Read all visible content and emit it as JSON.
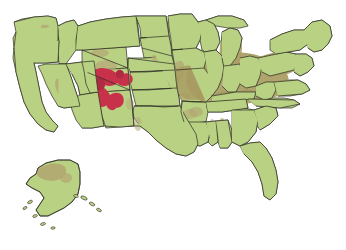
{
  "map": {
    "title": "United States Distribution Map",
    "type": "choropleth-overlay-map",
    "background_color": "#ffffff",
    "projection_note": "Albers-like continental US with Alaska inset at lower left",
    "legend_present": false,
    "labels_present": false,
    "colors": {
      "base_land": "#b9d183",
      "base_land_alt": "#bdd68a",
      "moderate_overlay": "#b3a673",
      "moderate_overlay_strong": "#a89b62",
      "moderate_overlay_soft": "#b8ac7e",
      "high_highlight": "#c8314a",
      "high_highlight_dark": "#b02a42",
      "border": "#2b2b22",
      "coast_border": "#333328",
      "water": "#ffffff"
    },
    "regions": {
      "high_intensity": {
        "name": "Four Corners core",
        "color": "#c8314a",
        "states": [
          "Colorado",
          "Utah",
          "New Mexico",
          "Arizona"
        ],
        "description": "Dense crimson cluster straddling southwestern Colorado, southeastern Utah, northwestern New Mexico and northeastern Arizona"
      },
      "moderate_intensity": {
        "name": "Diffuse tan overlay",
        "color": "#b3a673",
        "states": [
          "Ohio",
          "Indiana",
          "Illinois",
          "Kentucky",
          "Tennessee",
          "West Virginia",
          "Pennsylvania",
          "Michigan",
          "Missouri",
          "Montana",
          "Nevada",
          "Texas",
          "Oklahoma",
          "Kansas",
          "Nebraska",
          "Washington",
          "Alabama",
          "Alaska"
        ],
        "description": "Broad olive-tan shading heaviest across the Ohio Valley and lower Midwest, with scattered patches in the northern Rockies, Great Basin, southern Plains and northwestern Alaska"
      },
      "baseline": {
        "name": "Baseline land",
        "color": "#b9d183",
        "description": "Remaining states shown in plain light yellow-green"
      }
    },
    "insets": [
      {
        "name": "alaska-inset",
        "position": "lower-left",
        "has_overlay": true,
        "has_highlight": false
      }
    ],
    "hawaii_shown": false
  }
}
